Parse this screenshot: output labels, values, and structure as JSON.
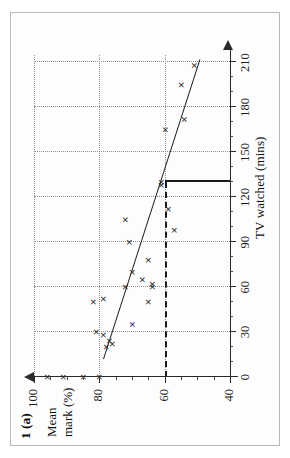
{
  "figure": {
    "question_label": "1 (a)",
    "y_axis_title_line1": "Mean",
    "y_axis_title_line2": "mark (%)",
    "x_axis_title": "TV watched (mins)"
  },
  "chart_data": {
    "type": "scatter",
    "title": "1 (a)",
    "xlabel": "TV watched (mins)",
    "ylabel": "Mean mark (%)",
    "xlim": [
      0,
      215
    ],
    "ylim": [
      40,
      100
    ],
    "xticks": [
      0,
      30,
      60,
      90,
      120,
      150,
      180,
      210
    ],
    "xticklabels": [
      "0",
      "30",
      "60",
      "90",
      "120",
      "150",
      "180",
      "210"
    ],
    "yticks": [
      40,
      60,
      80,
      100
    ],
    "yticklabels": [
      "40",
      "60",
      "80",
      "100"
    ],
    "x_minor_tick_step": 10,
    "y_minor_tick_step": 5,
    "grid": "dotted gridlines at major ticks",
    "legend": "none",
    "points": [
      {
        "x": 0,
        "y": 96
      },
      {
        "x": 0,
        "y": 91
      },
      {
        "x": 0,
        "y": 85
      },
      {
        "x": 0,
        "y": 80
      },
      {
        "x": 20,
        "y": 78
      },
      {
        "x": 22,
        "y": 76
      },
      {
        "x": 24,
        "y": 77
      },
      {
        "x": 28,
        "y": 79
      },
      {
        "x": 30,
        "y": 81
      },
      {
        "x": 35,
        "y": 70
      },
      {
        "x": 50,
        "y": 82
      },
      {
        "x": 50,
        "y": 65
      },
      {
        "x": 52,
        "y": 79
      },
      {
        "x": 60,
        "y": 72
      },
      {
        "x": 60,
        "y": 64
      },
      {
        "x": 62,
        "y": 64
      },
      {
        "x": 65,
        "y": 67
      },
      {
        "x": 70,
        "y": 70
      },
      {
        "x": 78,
        "y": 65
      },
      {
        "x": 90,
        "y": 71
      },
      {
        "x": 98,
        "y": 57
      },
      {
        "x": 105,
        "y": 72
      },
      {
        "x": 112,
        "y": 59
      },
      {
        "x": 128,
        "y": 61
      },
      {
        "x": 130,
        "y": 61
      },
      {
        "x": 165,
        "y": 60
      },
      {
        "x": 172,
        "y": 54
      },
      {
        "x": 195,
        "y": 55
      },
      {
        "x": 208,
        "y": 51
      }
    ],
    "fit_line": {
      "label": "line of best fit",
      "x_start": 12,
      "y_start": 79,
      "x_end": 212,
      "y_end": 49.5,
      "style": "solid"
    },
    "prediction": {
      "label": "reading taken at 130 mins",
      "x": 130,
      "y": 60,
      "style": "bold dashed"
    }
  }
}
